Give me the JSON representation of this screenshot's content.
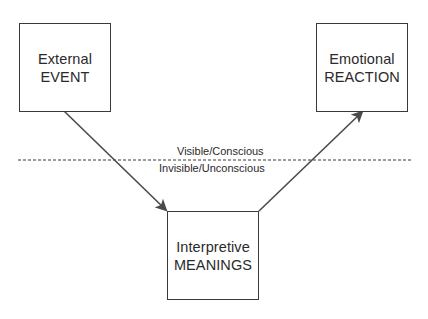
{
  "diagram": {
    "nodes": [
      {
        "id": "event",
        "line1": "External",
        "line2": "EVENT"
      },
      {
        "id": "meanings",
        "line1": "Interpretive",
        "line2": "MEANINGS"
      },
      {
        "id": "reaction",
        "line1": "Emotional",
        "line2": "REACTION"
      }
    ],
    "edges": [
      {
        "from": "event",
        "to": "meanings"
      },
      {
        "from": "meanings",
        "to": "reaction"
      }
    ],
    "divider": {
      "style": "dashed",
      "label_above": "Visible/Conscious",
      "label_below": "Invisible/Unconscious"
    },
    "colors": {
      "line": "#3a3a3a",
      "arrow": "#4a4a4a",
      "background": "#ffffff"
    }
  }
}
